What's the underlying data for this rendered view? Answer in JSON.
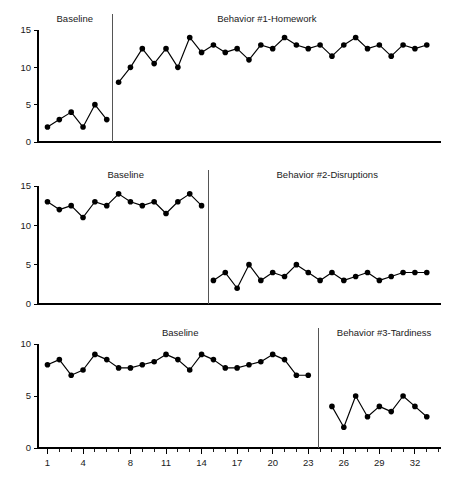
{
  "chart_data": {
    "type": "line",
    "title": "",
    "xlabel": "",
    "ylabel": "",
    "grid": false,
    "legend": "none",
    "xlim": [
      0.2,
      34.2
    ],
    "x_ticks_labeled": [
      1,
      4,
      8,
      11,
      14,
      17,
      20,
      23,
      26,
      29,
      32
    ],
    "panels": [
      {
        "name": "panel-1",
        "ylim": [
          0,
          15
        ],
        "y_ticks": [
          0,
          5,
          10,
          15
        ],
        "phase_line_x": 6.5,
        "x_axis_labels_visible": false,
        "phases": [
          {
            "label": "Baseline",
            "label_x": 3.3,
            "x": [
              1,
              2,
              3,
              4,
              5,
              6
            ],
            "values": [
              2,
              3,
              4,
              2,
              5,
              3
            ]
          },
          {
            "label": "Behavior #1-Homework",
            "label_x": 19.5,
            "x": [
              7,
              8,
              9,
              10,
              11,
              12,
              13,
              14,
              15,
              16,
              17,
              18,
              19,
              20,
              21,
              22,
              23,
              24,
              25,
              26,
              27,
              28,
              29,
              30,
              31,
              32,
              33
            ],
            "values": [
              8,
              10,
              12.5,
              10.5,
              12.5,
              10,
              14,
              12,
              13,
              12,
              12.5,
              11,
              13,
              12.5,
              14,
              13,
              12.5,
              13,
              11.5,
              13,
              14,
              12.5,
              13,
              11.5,
              13,
              12.5,
              13
            ]
          }
        ]
      },
      {
        "name": "panel-2",
        "ylim": [
          0,
          15
        ],
        "y_ticks": [
          0,
          5,
          10,
          15
        ],
        "phase_line_x": 14.6,
        "x_axis_labels_visible": false,
        "phases": [
          {
            "label": "Baseline",
            "label_x": 7.6,
            "x": [
              1,
              2,
              3,
              4,
              5,
              6,
              7,
              8,
              9,
              10,
              11,
              12,
              13,
              14
            ],
            "values": [
              13,
              12,
              12.5,
              11,
              13,
              12.5,
              14,
              13,
              12.5,
              13,
              11.5,
              13,
              14,
              12.5
            ]
          },
          {
            "label": "Behavior #2-Disruptions",
            "label_x": 24.6,
            "x": [
              15,
              16,
              17,
              18,
              19,
              20,
              21,
              22,
              23,
              24,
              25,
              26,
              27,
              28,
              29,
              30,
              31,
              32,
              33
            ],
            "values": [
              3,
              4,
              2,
              5,
              3,
              4,
              3.5,
              5,
              4,
              3,
              4,
              3,
              3.5,
              4,
              3,
              3.5,
              4,
              4,
              4
            ]
          }
        ]
      },
      {
        "name": "panel-3",
        "ylim": [
          0,
          10
        ],
        "y_ticks": [
          0,
          5,
          10
        ],
        "phase_line_x": 23.9,
        "x_axis_labels_visible": true,
        "phases": [
          {
            "label": "Baseline",
            "label_x": 12.2,
            "x": [
              1,
              2,
              3,
              4,
              5,
              6,
              7,
              8,
              9,
              10,
              11,
              12,
              13,
              14,
              15,
              16,
              17,
              18,
              19,
              20,
              21,
              22,
              23
            ],
            "values": [
              8,
              8.5,
              7,
              7.5,
              9,
              8.5,
              7.7,
              7.7,
              8,
              8.3,
              9,
              8.5,
              7.5,
              9,
              8.5,
              7.7,
              7.7,
              8,
              8.3,
              9,
              8.5,
              7,
              7
            ]
          },
          {
            "label": "Behavior #3-Tardiness",
            "label_x": 29.4,
            "x": [
              25,
              26,
              27,
              28,
              29,
              30,
              31,
              32,
              33
            ],
            "values": [
              4,
              2,
              5,
              3,
              4,
              3.5,
              5,
              4,
              3
            ]
          }
        ]
      }
    ]
  }
}
